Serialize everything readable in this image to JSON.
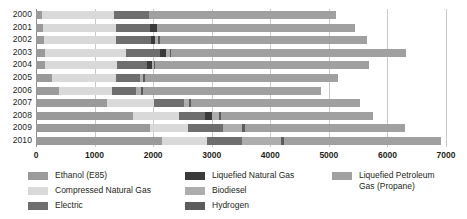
{
  "chart_data": {
    "type": "bar",
    "orientation": "horizontal",
    "stacked": true,
    "title": "",
    "xlabel": "",
    "ylabel": "",
    "xlim": [
      0,
      7000
    ],
    "xticks": [
      0,
      1000,
      2000,
      3000,
      4000,
      5000,
      6000,
      7000
    ],
    "xtick_labels": [
      "0",
      "1000",
      "2000",
      "3000",
      "4000",
      "5000",
      "6000",
      "7000"
    ],
    "grid": true,
    "grid_axis": "x",
    "legend_position": "bottom",
    "categories": [
      "2000",
      "2001",
      "2002",
      "2003",
      "2004",
      "2005",
      "2006",
      "2007",
      "2008",
      "2009",
      "2010"
    ],
    "series": [
      {
        "name": "Ethanol (E85)",
        "color": "#9a9a9a",
        "values": [
          100,
          120,
          130,
          150,
          160,
          280,
          400,
          1210,
          1660,
          1940,
          2150
        ]
      },
      {
        "name": "Compressed Natural Gas",
        "color": "#d9d9d9",
        "values": [
          1240,
          1250,
          1230,
          1380,
          1230,
          1080,
          900,
          800,
          790,
          650,
          770
        ]
      },
      {
        "name": "Electric",
        "color": "#6e6e6e",
        "values": [
          590,
          580,
          600,
          580,
          500,
          420,
          400,
          520,
          440,
          600,
          600
        ]
      },
      {
        "name": "Liquefied Natural Gas",
        "color": "#3a3a3a",
        "values": [
          0,
          110,
          80,
          110,
          90,
          0,
          0,
          0,
          110,
          0,
          0
        ]
      },
      {
        "name": "Biodiesel",
        "color": "#adadad",
        "values": [
          0,
          0,
          40,
          70,
          40,
          50,
          90,
          80,
          120,
          330,
          670
        ]
      },
      {
        "name": "Hydrogen",
        "color": "#5c5c5c",
        "values": [
          0,
          0,
          30,
          20,
          20,
          40,
          30,
          30,
          40,
          50,
          50
        ]
      },
      {
        "name": "Liquefied Petroleum Gas (Propane)",
        "color": "#a0a0a0",
        "values": [
          3190,
          3380,
          3550,
          4000,
          3640,
          3280,
          3050,
          2890,
          2590,
          2730,
          2670
        ]
      }
    ],
    "totals": [
      5120,
      5440,
      5660,
      6310,
      5680,
      5150,
      4870,
      5530,
      5750,
      6300,
      6910
    ]
  },
  "legend": {
    "columns": [
      {
        "items": [
          {
            "label": "Ethanol (E85)",
            "series": 0
          },
          {
            "label": "Compressed Natural Gas",
            "series": 1
          },
          {
            "label": "Electric",
            "series": 2
          }
        ]
      },
      {
        "items": [
          {
            "label": "Liquefied Natural Gas",
            "series": 3
          },
          {
            "label": "Biodiesel",
            "series": 4
          },
          {
            "label": "Hydrogen",
            "series": 5
          }
        ]
      },
      {
        "items": [
          {
            "label": "Liquefied Petroleum\nGas (Propane)",
            "series": 6
          }
        ]
      }
    ]
  },
  "colors": {
    "grid": "#c9c9c9",
    "axis": "#8d8d8d",
    "text": "#231f20",
    "background": "#ffffff"
  }
}
